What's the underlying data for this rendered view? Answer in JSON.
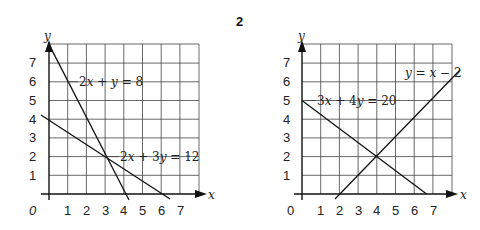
{
  "problem_number": "2",
  "graphs": [
    {
      "id": "left",
      "x_axis_label": "x",
      "y_axis_label": "y",
      "origin_label": "0",
      "x_ticks": [
        "1",
        "2",
        "3",
        "4",
        "5",
        "6",
        "7"
      ],
      "y_ticks": [
        "1",
        "2",
        "3",
        "4",
        "5",
        "6",
        "7"
      ],
      "lines": [
        {
          "equation": "2x + y = 8",
          "label_parts": [
            "2",
            "x",
            " + ",
            "y",
            " = 8"
          ]
        },
        {
          "equation": "2x + 3y = 12",
          "label_parts": [
            "2",
            "x",
            " + 3",
            "y",
            " = 12"
          ]
        }
      ],
      "intersection": [
        3,
        2
      ]
    },
    {
      "id": "right",
      "x_axis_label": "x",
      "y_axis_label": "y",
      "origin_label": "0",
      "x_ticks": [
        "1",
        "2",
        "3",
        "4",
        "5",
        "6",
        "7"
      ],
      "y_ticks": [
        "1",
        "2",
        "3",
        "4",
        "5",
        "6",
        "7"
      ],
      "lines": [
        {
          "equation": "3x + 4y = 20",
          "label_parts": [
            "3",
            "x",
            " + 4",
            "y",
            " = 20"
          ]
        },
        {
          "equation": "y = x − 2",
          "label_parts": [
            "y",
            " = ",
            "x",
            " − 2"
          ]
        }
      ],
      "intersection": [
        4,
        2
      ]
    }
  ]
}
